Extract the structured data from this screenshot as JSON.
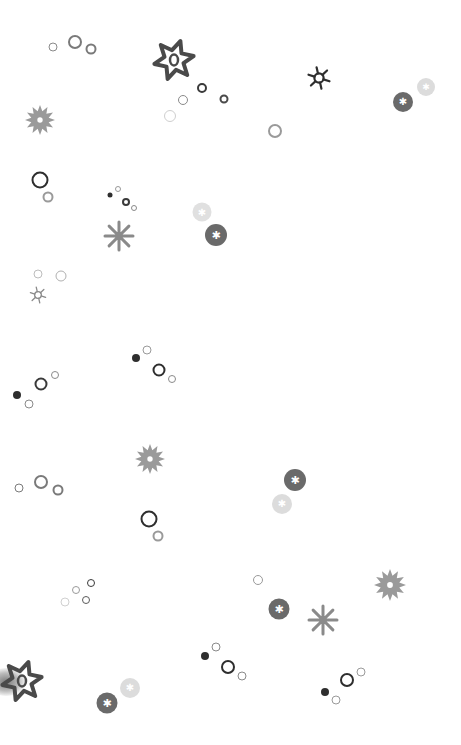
{
  "pattern": {
    "background": "#ffffff",
    "colors": {
      "dark": "#3a3a3a",
      "mid": "#6a6a6a",
      "light": "#9a9a9a",
      "pale": "#cfcfcf"
    },
    "rings": [
      {
        "x": 53,
        "y": 47,
        "d": 9,
        "w": 1.5,
        "c": "#8a8a8a"
      },
      {
        "x": 75,
        "y": 42,
        "d": 14,
        "w": 2,
        "c": "#7a7a7a"
      },
      {
        "x": 91,
        "y": 49,
        "d": 11,
        "w": 2,
        "c": "#7a7a7a"
      },
      {
        "x": 202,
        "y": 88,
        "d": 10,
        "w": 2.2,
        "c": "#3a3a3a"
      },
      {
        "x": 183,
        "y": 100,
        "d": 10,
        "w": 1.8,
        "c": "#8a8a8a"
      },
      {
        "x": 224,
        "y": 99,
        "d": 9,
        "w": 2,
        "c": "#4a4a4a"
      },
      {
        "x": 170,
        "y": 116,
        "d": 12,
        "w": 1.5,
        "c": "#cfcfcf"
      },
      {
        "x": 275,
        "y": 131,
        "d": 14,
        "w": 2,
        "c": "#9a9a9a"
      },
      {
        "x": 40,
        "y": 180,
        "d": 17,
        "w": 2.5,
        "c": "#2e2e2e"
      },
      {
        "x": 48,
        "y": 197,
        "d": 11,
        "w": 2,
        "c": "#9a9a9a"
      },
      {
        "x": 118,
        "y": 189,
        "d": 6,
        "w": 1.2,
        "c": "#999999"
      },
      {
        "x": 126,
        "y": 202,
        "d": 8,
        "w": 2,
        "c": "#3a3a3a"
      },
      {
        "x": 134,
        "y": 208,
        "d": 6,
        "w": 1.2,
        "c": "#8a8a8a"
      },
      {
        "x": 38,
        "y": 274,
        "d": 9,
        "w": 1.5,
        "c": "#bdbdbd"
      },
      {
        "x": 61,
        "y": 276,
        "d": 11,
        "w": 1.8,
        "c": "#b0b0b0"
      },
      {
        "x": 147,
        "y": 350,
        "d": 9,
        "w": 1.5,
        "c": "#9a9a9a"
      },
      {
        "x": 159,
        "y": 370,
        "d": 13,
        "w": 2.5,
        "c": "#2e2e2e"
      },
      {
        "x": 172,
        "y": 379,
        "d": 8,
        "w": 1.5,
        "c": "#8a8a8a"
      },
      {
        "x": 41,
        "y": 384,
        "d": 13,
        "w": 2.5,
        "c": "#3a3a3a"
      },
      {
        "x": 55,
        "y": 375,
        "d": 8,
        "w": 1.5,
        "c": "#8a8a8a"
      },
      {
        "x": 29,
        "y": 404,
        "d": 9,
        "w": 1.5,
        "c": "#8a8a8a"
      },
      {
        "x": 19,
        "y": 488,
        "d": 9,
        "w": 1.5,
        "c": "#7a7a7a"
      },
      {
        "x": 41,
        "y": 482,
        "d": 14,
        "w": 2,
        "c": "#7a7a7a"
      },
      {
        "x": 58,
        "y": 490,
        "d": 11,
        "w": 2,
        "c": "#7a7a7a"
      },
      {
        "x": 149,
        "y": 519,
        "d": 17,
        "w": 2.5,
        "c": "#2e2e2e"
      },
      {
        "x": 158,
        "y": 536,
        "d": 11,
        "w": 2,
        "c": "#9a9a9a"
      },
      {
        "x": 91,
        "y": 583,
        "d": 8,
        "w": 1.8,
        "c": "#3a3a3a"
      },
      {
        "x": 76,
        "y": 590,
        "d": 8,
        "w": 1.5,
        "c": "#9a9a9a"
      },
      {
        "x": 86,
        "y": 600,
        "d": 8,
        "w": 1.8,
        "c": "#5a5a5a"
      },
      {
        "x": 65,
        "y": 602,
        "d": 9,
        "w": 1.2,
        "c": "#d0d0d0"
      },
      {
        "x": 258,
        "y": 580,
        "d": 10,
        "w": 1.5,
        "c": "#9a9a9a"
      },
      {
        "x": 216,
        "y": 647,
        "d": 9,
        "w": 1.5,
        "c": "#8a8a8a"
      },
      {
        "x": 228,
        "y": 667,
        "d": 14,
        "w": 2.5,
        "c": "#2e2e2e"
      },
      {
        "x": 242,
        "y": 676,
        "d": 9,
        "w": 1.5,
        "c": "#8a8a8a"
      },
      {
        "x": 347,
        "y": 680,
        "d": 14,
        "w": 2.5,
        "c": "#2e2e2e"
      },
      {
        "x": 361,
        "y": 672,
        "d": 9,
        "w": 1.5,
        "c": "#9a9a9a"
      },
      {
        "x": 336,
        "y": 700,
        "d": 9,
        "w": 1.5,
        "c": "#9a9a9a"
      }
    ],
    "dots": [
      {
        "x": 110,
        "y": 195,
        "d": 5,
        "c": "#2e2e2e"
      },
      {
        "x": 136,
        "y": 358,
        "d": 8,
        "c": "#2e2e2e"
      },
      {
        "x": 17,
        "y": 395,
        "d": 8,
        "c": "#2e2e2e"
      },
      {
        "x": 205,
        "y": 656,
        "d": 8,
        "c": "#2e2e2e"
      },
      {
        "x": 325,
        "y": 692,
        "d": 8,
        "c": "#2e2e2e"
      }
    ],
    "badges": [
      {
        "x": 403,
        "y": 102,
        "d": 20,
        "c": "#6a6a6a",
        "glyph": "✱"
      },
      {
        "x": 426,
        "y": 87,
        "d": 18,
        "c": "#dcdcdc",
        "glyph": "✱"
      },
      {
        "x": 202,
        "y": 212,
        "d": 19,
        "c": "#e0e0e0",
        "glyph": "✱"
      },
      {
        "x": 216,
        "y": 235,
        "d": 22,
        "c": "#6a6a6a",
        "glyph": "✱"
      },
      {
        "x": 295,
        "y": 480,
        "d": 22,
        "c": "#6a6a6a",
        "glyph": "✱"
      },
      {
        "x": 282,
        "y": 504,
        "d": 20,
        "c": "#dcdcdc",
        "glyph": "✱"
      },
      {
        "x": 279,
        "y": 609,
        "d": 21,
        "c": "#6a6a6a",
        "glyph": "✱"
      },
      {
        "x": 107,
        "y": 703,
        "d": 21,
        "c": "#6a6a6a",
        "glyph": "✱"
      },
      {
        "x": 130,
        "y": 688,
        "d": 20,
        "c": "#dcdcdc",
        "glyph": "✱"
      }
    ],
    "flowers": [
      {
        "x": 40,
        "y": 120,
        "r": 15,
        "points": 12,
        "c": "#9a9a9a"
      },
      {
        "x": 150,
        "y": 459,
        "r": 15,
        "points": 12,
        "c": "#9a9a9a"
      },
      {
        "x": 390,
        "y": 585,
        "r": 16,
        "points": 12,
        "c": "#9a9a9a"
      }
    ],
    "asterisks": [
      {
        "x": 119,
        "y": 236,
        "r": 14,
        "arms": 8,
        "c": "#8a8a8a"
      },
      {
        "x": 323,
        "y": 620,
        "r": 14,
        "arms": 8,
        "c": "#8a8a8a"
      }
    ],
    "suns": [
      {
        "x": 319,
        "y": 78,
        "r": 11,
        "c": "#2e2e2e",
        "w": 2.2
      },
      {
        "x": 38,
        "y": 295,
        "r": 8,
        "c": "#8a8a8a",
        "w": 1.3
      }
    ],
    "stars": [
      {
        "x": 174,
        "y": 60,
        "r": 20,
        "c": "#4a4a4a"
      },
      {
        "x": 22,
        "y": 681,
        "r": 20,
        "c": "#4a4a4a"
      }
    ]
  }
}
